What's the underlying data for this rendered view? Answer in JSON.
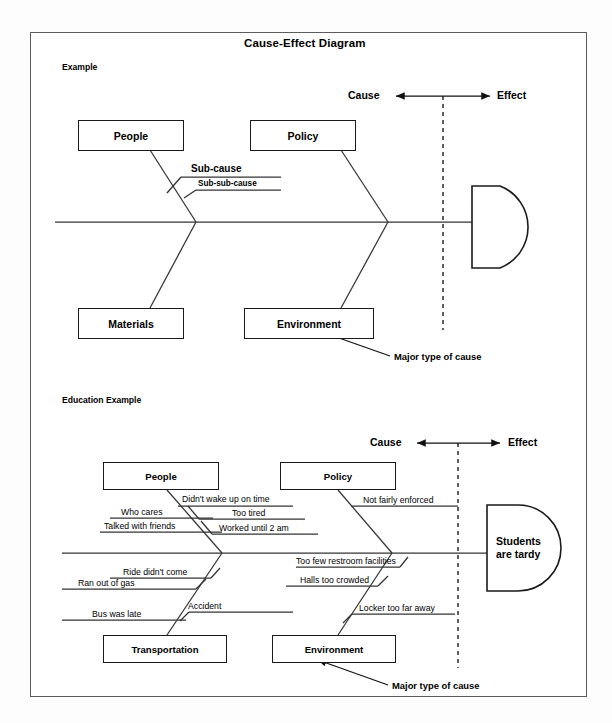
{
  "document": {
    "title": "Cause-Effect Diagram"
  },
  "example": {
    "heading": "Example",
    "axis": {
      "cause_label": "Cause",
      "effect_label": "Effect"
    },
    "categories": [
      {
        "label": "People",
        "position": "top-left"
      },
      {
        "label": "Policy",
        "position": "top-right"
      },
      {
        "label": "Materials",
        "position": "bottom-left"
      },
      {
        "label": "Environment",
        "position": "bottom-right"
      }
    ],
    "sub_causes": [
      {
        "label": "Sub-cause",
        "level": 1
      },
      {
        "label": "Sub-sub-cause",
        "level": 2
      }
    ],
    "effect_box": {
      "label": ""
    },
    "annotation": "Major type of cause"
  },
  "education_example": {
    "heading": "Education Example",
    "axis": {
      "cause_label": "Cause",
      "effect_label": "Effect"
    },
    "categories": [
      {
        "label": "People",
        "position": "top-left"
      },
      {
        "label": "Policy",
        "position": "top-right"
      },
      {
        "label": "Transportation",
        "position": "bottom-left"
      },
      {
        "label": "Environment",
        "position": "bottom-right"
      }
    ],
    "sub_causes": {
      "people": [
        "Didn't wake up on time",
        "Who cares",
        "Talked with friends",
        "Too tired",
        "Worked until 2 am"
      ],
      "policy": [
        "Not fairly enforced"
      ],
      "transportation": [
        "Ride didn't come",
        "Ran out of gas",
        "Bus was late",
        "Accident"
      ],
      "environment": [
        "Too few restroom facilities",
        "Halls too crowded",
        "Locker too far away"
      ]
    },
    "effect_box": {
      "line1": "Students",
      "line2": "are tardy"
    },
    "annotation": "Major type of cause"
  },
  "colors": {
    "ink": "#1a1a1a",
    "frame": "#5c5c5c",
    "line": "#333333",
    "background": "#ffffff"
  }
}
